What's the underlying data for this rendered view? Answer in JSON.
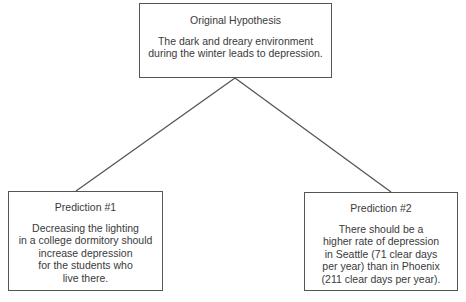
{
  "diagram": {
    "root": {
      "title": "Original Hypothesis",
      "body": "The dark and dreary environment\nduring the winter leads to depression."
    },
    "predictions": [
      {
        "title": "Prediction #1",
        "body": "Decreasing the lighting\nin a college dormitory should\nincrease depression\nfor the students who\nlive there."
      },
      {
        "title": "Prediction #2",
        "body": "There should be a\nhigher rate of depression\nin Seattle (71 clear days\nper year) than in Phoenix\n(211 clear days per year)."
      }
    ],
    "colors": {
      "line": "#555555",
      "text": "#3a3a3a",
      "background": "#ffffff"
    }
  }
}
